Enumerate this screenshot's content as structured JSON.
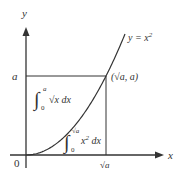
{
  "diagram": {
    "axes": {
      "x_label": "x",
      "y_label": "y",
      "origin_label": "0"
    },
    "curve": {
      "label": "y = x",
      "label_exp": "2"
    },
    "point": {
      "label": "(√a, a)"
    },
    "ticks": {
      "y_tick": "a",
      "x_tick": "√a"
    },
    "integral_upper": {
      "lower": "0",
      "upper": "a",
      "integrand": "√x dx"
    },
    "integral_lower": {
      "lower": "0",
      "upper": "√a",
      "integrand": "x",
      "integrand_exp": "2",
      "dx": " dx"
    }
  }
}
